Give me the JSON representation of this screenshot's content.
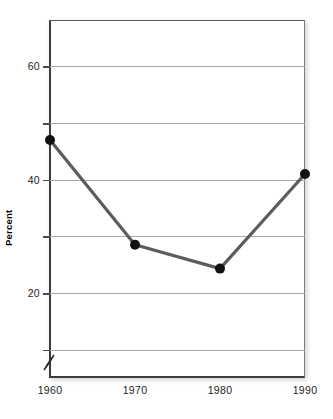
{
  "chart_data": {
    "type": "line",
    "title": "",
    "subtitle": "",
    "xlabel": "",
    "ylabel": "Percent",
    "x": [
      1960,
      1970,
      1980,
      1990
    ],
    "categories": [
      "1960",
      "1970",
      "1980",
      "1990"
    ],
    "values": [
      47,
      28.5,
      24.3,
      41
    ],
    "series": [
      {
        "name": "Percent",
        "values": [
          47,
          28.5,
          24.3,
          41
        ]
      }
    ],
    "xlim": [
      1960,
      1990
    ],
    "ylim": [
      5,
      68
    ],
    "y_tick_values": [
      60,
      50,
      40,
      30,
      20,
      10
    ],
    "y_tick_labels": [
      "60",
      "",
      "40",
      "",
      "20",
      ""
    ],
    "x_tick_labels": [
      "1960",
      "1970",
      "1980",
      "1990"
    ],
    "grid": true,
    "legend": false,
    "legend_position": "none",
    "axis_break": true,
    "marker": "circle",
    "colors": {
      "line": "#5c5c5c",
      "marker": "#111111",
      "gridline": "#a8a8a8",
      "axis": "#3c3c3c",
      "text": "#1d1d1d",
      "background": "#ffffff"
    }
  },
  "annotations": {
    "y_axis_title": "Percent",
    "axis_break_symbol": "//"
  }
}
